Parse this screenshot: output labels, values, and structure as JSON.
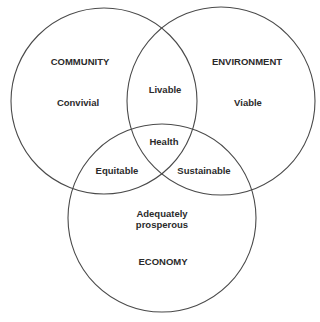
{
  "diagram": {
    "type": "venn",
    "sets": [
      {
        "id": "community",
        "label": "COMMUNITY",
        "quality": "Convivial"
      },
      {
        "id": "environment",
        "label": "ENVIRONMENT",
        "quality": "Viable"
      },
      {
        "id": "economy",
        "label": "ECONOMY",
        "quality_line1": "Adequately",
        "quality_line2": "prosperous"
      }
    ],
    "intersections": {
      "community_environment": "Livable",
      "community_economy": "Equitable",
      "environment_economy": "Sustainable",
      "all": "Health"
    },
    "colors": {
      "stroke": "#4a4a4a",
      "text": "#2b2b2b",
      "background": "#ffffff"
    }
  }
}
